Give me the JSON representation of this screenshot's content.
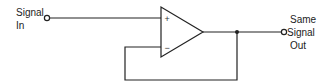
{
  "diagram": {
    "type": "op-amp voltage follower (unity-gain buffer)",
    "input_label": {
      "line1": "Signal",
      "line2": "In"
    },
    "output_label": {
      "line1": "Same",
      "line2": "Signal",
      "line3": "Out"
    },
    "opamp": {
      "noninverting_symbol": "+",
      "inverting_symbol": "−"
    },
    "colors": {
      "stroke": "#222222",
      "background": "#ffffff"
    }
  }
}
